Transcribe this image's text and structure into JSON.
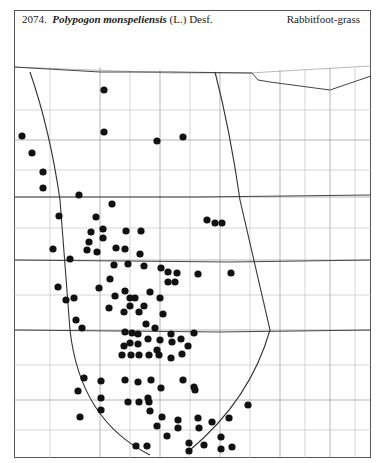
{
  "header": {
    "number": "2074.",
    "genus_species": "Polypogon monspeliensis",
    "authority": "(L.) Desf.",
    "common_name": "Rabbitfoot-grass"
  },
  "map": {
    "region": "Great Plains",
    "dot_color": "#111111",
    "line_color": "#555555",
    "dots": [
      [
        104,
        90
      ],
      [
        104,
        132
      ],
      [
        157,
        141
      ],
      [
        183,
        137
      ],
      [
        22,
        136
      ],
      [
        32,
        153
      ],
      [
        43,
        172
      ],
      [
        43,
        188
      ],
      [
        79,
        195
      ],
      [
        112,
        204
      ],
      [
        59,
        216
      ],
      [
        96,
        217
      ],
      [
        91,
        232
      ],
      [
        103,
        229
      ],
      [
        89,
        242
      ],
      [
        103,
        238
      ],
      [
        53,
        249
      ],
      [
        70,
        259
      ],
      [
        87,
        250
      ],
      [
        97,
        252
      ],
      [
        126,
        231
      ],
      [
        141,
        231
      ],
      [
        116,
        248
      ],
      [
        125,
        249
      ],
      [
        140,
        254
      ],
      [
        128,
        264
      ],
      [
        114,
        265
      ],
      [
        144,
        266
      ],
      [
        161,
        268
      ],
      [
        177,
        273
      ],
      [
        168,
        272
      ],
      [
        175,
        282
      ],
      [
        168,
        282
      ],
      [
        207,
        220
      ],
      [
        215,
        223
      ],
      [
        222,
        223
      ],
      [
        198,
        274
      ],
      [
        231,
        273
      ],
      [
        110,
        279
      ],
      [
        99,
        288
      ],
      [
        125,
        291
      ],
      [
        115,
        296
      ],
      [
        135,
        298
      ],
      [
        130,
        298
      ],
      [
        150,
        292
      ],
      [
        130,
        306
      ],
      [
        109,
        308
      ],
      [
        124,
        312
      ],
      [
        144,
        306
      ],
      [
        160,
        298
      ],
      [
        163,
        314
      ],
      [
        146,
        324
      ],
      [
        139,
        312
      ],
      [
        76,
        320
      ],
      [
        58,
        287
      ],
      [
        74,
        298
      ],
      [
        66,
        300
      ],
      [
        82,
        328
      ],
      [
        125,
        332
      ],
      [
        132,
        333
      ],
      [
        138,
        334
      ],
      [
        155,
        328
      ],
      [
        160,
        340
      ],
      [
        124,
        346
      ],
      [
        130,
        343
      ],
      [
        138,
        344
      ],
      [
        148,
        339
      ],
      [
        157,
        350
      ],
      [
        122,
        355
      ],
      [
        131,
        355
      ],
      [
        139,
        355
      ],
      [
        149,
        355
      ],
      [
        159,
        355
      ],
      [
        171,
        358
      ],
      [
        182,
        354
      ],
      [
        188,
        346
      ],
      [
        181,
        339
      ],
      [
        172,
        342
      ],
      [
        194,
        333
      ],
      [
        171,
        334
      ],
      [
        183,
        380
      ],
      [
        194,
        387
      ],
      [
        84,
        378
      ],
      [
        101,
        381
      ],
      [
        125,
        380
      ],
      [
        138,
        382
      ],
      [
        151,
        380
      ],
      [
        161,
        388
      ],
      [
        148,
        398
      ],
      [
        78,
        391
      ],
      [
        101,
        398
      ],
      [
        101,
        410
      ],
      [
        128,
        402
      ],
      [
        139,
        402
      ],
      [
        149,
        402
      ],
      [
        150,
        411
      ],
      [
        162,
        417
      ],
      [
        157,
        426
      ],
      [
        167,
        436
      ],
      [
        178,
        428
      ],
      [
        195,
        390
      ],
      [
        198,
        418
      ],
      [
        199,
        428
      ],
      [
        212,
        422
      ],
      [
        229,
        418
      ],
      [
        204,
        445
      ],
      [
        221,
        449
      ],
      [
        232,
        447
      ],
      [
        248,
        405
      ],
      [
        80,
        417
      ],
      [
        136,
        446
      ],
      [
        147,
        446
      ],
      [
        189,
        443
      ],
      [
        189,
        451
      ],
      [
        221,
        437
      ],
      [
        178,
        420
      ]
    ]
  }
}
